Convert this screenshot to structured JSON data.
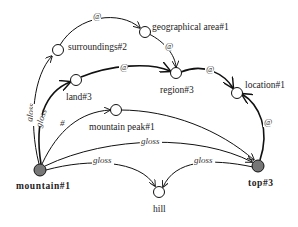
{
  "diagram": {
    "nodes": [
      {
        "id": "mountain1",
        "label": "mountain#1",
        "filled": true,
        "bold": true
      },
      {
        "id": "top3",
        "label": "top#3",
        "filled": true,
        "bold": true
      },
      {
        "id": "hill",
        "label": "hill",
        "filled": false,
        "bold": false
      },
      {
        "id": "mountainpeak1",
        "label": "mountain peak#1",
        "filled": false,
        "bold": false
      },
      {
        "id": "land3",
        "label": "land#3",
        "filled": false,
        "bold": false
      },
      {
        "id": "region3",
        "label": "region#3",
        "filled": false,
        "bold": false
      },
      {
        "id": "location1",
        "label": "location#1",
        "filled": false,
        "bold": false
      },
      {
        "id": "surroundings2",
        "label": "surroundings#2",
        "filled": false,
        "bold": false
      },
      {
        "id": "geoarea1",
        "label": "geographical area#1",
        "filled": false,
        "bold": false
      }
    ],
    "edges": [
      {
        "from": "mountain1",
        "to": "surroundings2",
        "label": "gloss"
      },
      {
        "from": "mountain1",
        "to": "land3",
        "label": "gloss"
      },
      {
        "from": "mountain1",
        "to": "mountainpeak1",
        "label": "#"
      },
      {
        "from": "mountain1",
        "to": "top3",
        "label": "gloss"
      },
      {
        "from": "mountain1",
        "to": "hill",
        "label": "gloss"
      },
      {
        "from": "top3",
        "to": "hill",
        "label": "gloss"
      },
      {
        "from": "mountainpeak1",
        "to": "top3",
        "label": ""
      },
      {
        "from": "surroundings2",
        "to": "geoarea1",
        "label": "@"
      },
      {
        "from": "geoarea1",
        "to": "region3",
        "label": "@"
      },
      {
        "from": "land3",
        "to": "region3",
        "label": "@"
      },
      {
        "from": "region3",
        "to": "location1",
        "label": "@"
      },
      {
        "from": "top3",
        "to": "location1",
        "label": "@"
      }
    ]
  }
}
